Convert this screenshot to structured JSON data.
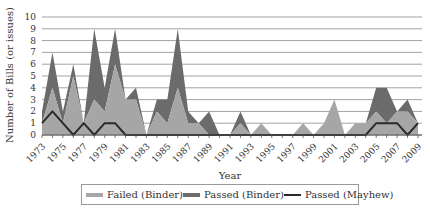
{
  "chart_data": {
    "type": "area",
    "stacked": true,
    "title": "",
    "xlabel": "Year",
    "ylabel": "Number of Bills (or issues)",
    "ylim": [
      0,
      10
    ],
    "yticks": [
      0,
      1,
      2,
      3,
      4,
      5,
      6,
      7,
      8,
      9,
      10
    ],
    "grid": true,
    "legend_position": "bottom",
    "x": [
      1973,
      1974,
      1975,
      1976,
      1977,
      1978,
      1979,
      1980,
      1981,
      1982,
      1983,
      1984,
      1985,
      1986,
      1987,
      1988,
      1989,
      1990,
      1991,
      1992,
      1993,
      1994,
      1995,
      1996,
      1997,
      1998,
      1999,
      2000,
      2001,
      2002,
      2003,
      2004,
      2005,
      2006,
      2007,
      2008,
      2009
    ],
    "xtick_labels": [
      "1973",
      "1975",
      "1977",
      "1979",
      "1981",
      "1983",
      "1985",
      "1987",
      "1989",
      "1991",
      "1993",
      "1995",
      "1997",
      "1999",
      "2001",
      "2003",
      "2005",
      "2007",
      "2009"
    ],
    "series": [
      {
        "name": "Failed (Binder)",
        "kind": "area",
        "color": "#a6a6a6",
        "values": [
          1,
          4,
          1,
          5,
          1,
          3,
          2,
          6,
          3,
          3,
          0,
          2,
          1,
          4,
          1,
          1,
          0,
          0,
          0,
          1,
          0,
          1,
          0,
          0,
          0,
          1,
          0,
          1,
          3,
          0,
          1,
          1,
          2,
          1,
          2,
          2,
          1
        ]
      },
      {
        "name": "Passed (Binder)",
        "kind": "area",
        "color": "#6b6b6b",
        "values": [
          1,
          3,
          1,
          1,
          0,
          6,
          2,
          3,
          0,
          1,
          0,
          1,
          2,
          5,
          1,
          0,
          2,
          0,
          0,
          1,
          0,
          0,
          0,
          0,
          0,
          0,
          0,
          0,
          0,
          0,
          0,
          0,
          2,
          3,
          0,
          1,
          0
        ]
      },
      {
        "name": "Passed (Mayhew)",
        "kind": "line",
        "color": "#2a2a2a",
        "values": [
          1,
          2,
          1,
          0,
          1,
          0,
          1,
          1,
          0,
          0,
          0,
          0,
          0,
          0,
          0,
          0,
          0,
          0,
          0,
          0,
          0,
          0,
          0,
          0,
          0,
          0,
          0,
          0,
          0,
          0,
          0,
          0,
          1,
          1,
          1,
          0,
          1
        ]
      }
    ]
  },
  "axes": {
    "xlabel": "Year",
    "ylabel": "Number of Bills (or issues)"
  },
  "legend": {
    "items": [
      {
        "label": "Failed (Binder)",
        "color": "#a6a6a6",
        "kind": "area"
      },
      {
        "label": "Passed (Binder)",
        "color": "#6b6b6b",
        "kind": "area"
      },
      {
        "label": "Passed (Mayhew)",
        "color": "#2a2a2a",
        "kind": "line"
      }
    ]
  }
}
